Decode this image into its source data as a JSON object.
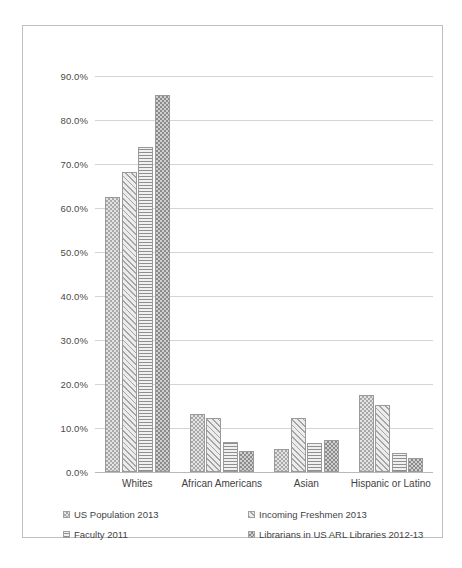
{
  "chart_data": {
    "type": "bar",
    "title": "",
    "xlabel": "",
    "ylabel": "",
    "ylim": [
      0,
      90
    ],
    "grid": true,
    "legend_position": "bottom",
    "categories": [
      "Whites",
      "African Americans",
      "Asian",
      "Hispanic or Latino"
    ],
    "ytick_labels": [
      "0.0%",
      "10.0%",
      "20.0%",
      "30.0%",
      "40.0%",
      "50.0%",
      "60.0%",
      "70.0%",
      "80.0%",
      "90.0%"
    ],
    "ytick_values": [
      0,
      10,
      20,
      30,
      40,
      50,
      60,
      70,
      80,
      90
    ],
    "series": [
      {
        "name": "US Population 2013",
        "pattern": "checker-light",
        "values": [
          62.6,
          13.2,
          5.3,
          17.4
        ]
      },
      {
        "name": "Incoming Freshmen 2013",
        "pattern": "diagonal-stripes",
        "values": [
          68.2,
          12.3,
          12.2,
          15.2
        ]
      },
      {
        "name": "Faculty 2011",
        "pattern": "horizontal-lines",
        "values": [
          73.8,
          6.9,
          6.5,
          4.3
        ]
      },
      {
        "name": "Librarians in US ARL Libraries 2012-13",
        "pattern": "checker-dark",
        "values": [
          85.6,
          4.8,
          7.2,
          3.2
        ]
      }
    ]
  },
  "legend": {
    "rows": [
      [
        "US Population 2013",
        "Incoming Freshmen 2013"
      ],
      [
        "Faculty 2011",
        "Librarians in US ARL Libraries 2012-13"
      ]
    ]
  },
  "colors": {
    "border": "#bfbfbf",
    "gridline": "#d4d4d4",
    "bar_outline": "#9a9a9a",
    "text": "#3a3a3a"
  }
}
